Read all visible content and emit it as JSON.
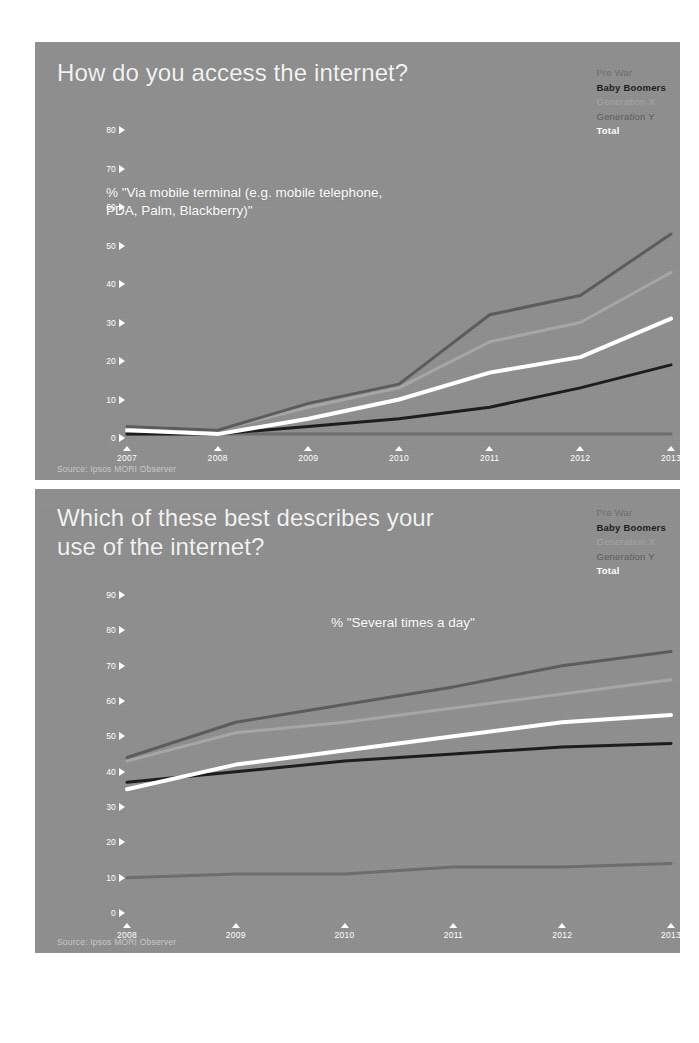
{
  "deck": {
    "background": "#ffffff",
    "slide_background": "#8f8f8f"
  },
  "palette": {
    "pre_war": "#6d6d6d",
    "baby_boomers": "#1d1d1d",
    "generation_x": "#a6a6a6",
    "generation_y": "#5c5c5c",
    "total": "#ffffff",
    "axis_text": "#ffffff",
    "title_text": "#f2f2f2",
    "source_text": "#c9c9c9"
  },
  "slides": [
    {
      "id": "slide-1",
      "title": "How do you access the internet?",
      "subtitle": "% \"Via mobile terminal (e.g. mobile telephone,\nPDA, Palm, Blackberry)\"",
      "source": "Source: Ipsos MORI Observer",
      "legend": [
        {
          "label": "Pre War",
          "color": "#6d6d6d",
          "bold": false
        },
        {
          "label": "Baby Boomers",
          "color": "#1d1d1d",
          "bold": true
        },
        {
          "label": "Generation X",
          "color": "#a6a6a6",
          "bold": false
        },
        {
          "label": "Generation Y",
          "color": "#5c5c5c",
          "bold": false
        },
        {
          "label": "Total",
          "color": "#ffffff",
          "bold": true
        }
      ],
      "chart_data": {
        "type": "line",
        "title": "How do you access the internet?",
        "subtitle": "% \"Via mobile terminal (e.g. mobile telephone, PDA, Palm, Blackberry)\"",
        "xlabel": "",
        "ylabel": "",
        "categories": [
          "2007",
          "2008",
          "2009",
          "2010",
          "2011",
          "2012",
          "2013"
        ],
        "yticks": [
          0,
          10,
          20,
          30,
          40,
          50,
          60,
          70,
          80
        ],
        "ylim": [
          0,
          80
        ],
        "grid": false,
        "legend_position": "top-right",
        "series": [
          {
            "name": "Pre War",
            "color": "#6d6d6d",
            "values": [
              1,
              1,
              1,
              1,
              1,
              1,
              1
            ]
          },
          {
            "name": "Baby Boomers",
            "color": "#1d1d1d",
            "values": [
              1,
              1,
              3,
              5,
              8,
              13,
              19
            ]
          },
          {
            "name": "Generation X",
            "color": "#a6a6a6",
            "values": [
              3,
              2,
              8,
              13,
              25,
              30,
              43
            ]
          },
          {
            "name": "Generation Y",
            "color": "#5c5c5c",
            "values": [
              3,
              2,
              9,
              14,
              32,
              37,
              53
            ]
          },
          {
            "name": "Total",
            "color": "#ffffff",
            "values": [
              2,
              1,
              5,
              10,
              17,
              21,
              31
            ]
          }
        ]
      }
    },
    {
      "id": "slide-2",
      "title": "Which of these best describes your\nuse of the internet?",
      "subtitle": "% \"Several times a day\"",
      "source": "Source: Ipsos MORI Observer",
      "legend": [
        {
          "label": "Pre War",
          "color": "#6d6d6d",
          "bold": false
        },
        {
          "label": "Baby Boomers",
          "color": "#1d1d1d",
          "bold": true
        },
        {
          "label": "Generation X",
          "color": "#a6a6a6",
          "bold": false
        },
        {
          "label": "Generation Y",
          "color": "#5c5c5c",
          "bold": false
        },
        {
          "label": "Total",
          "color": "#ffffff",
          "bold": true
        }
      ],
      "chart_data": {
        "type": "line",
        "title": "Which of these best describes your use of the internet?",
        "subtitle": "% \"Several times a day\"",
        "xlabel": "",
        "ylabel": "",
        "categories": [
          "2008",
          "2009",
          "2010",
          "2011",
          "2012",
          "2013"
        ],
        "yticks": [
          0,
          10,
          20,
          30,
          40,
          50,
          60,
          70,
          80,
          90
        ],
        "ylim": [
          0,
          90
        ],
        "grid": false,
        "legend_position": "top-right",
        "series": [
          {
            "name": "Pre War",
            "color": "#6d6d6d",
            "values": [
              10,
              11,
              11,
              13,
              13,
              14
            ]
          },
          {
            "name": "Baby Boomers",
            "color": "#1d1d1d",
            "values": [
              37,
              40,
              43,
              45,
              47,
              48
            ]
          },
          {
            "name": "Generation X",
            "color": "#a6a6a6",
            "values": [
              43,
              51,
              54,
              58,
              62,
              66
            ]
          },
          {
            "name": "Generation Y",
            "color": "#5c5c5c",
            "values": [
              44,
              54,
              59,
              64,
              70,
              74
            ]
          },
          {
            "name": "Total",
            "color": "#ffffff",
            "values": [
              35,
              42,
              46,
              50,
              54,
              56
            ]
          }
        ]
      }
    }
  ]
}
